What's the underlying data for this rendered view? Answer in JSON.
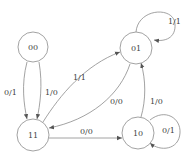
{
  "diagram": {
    "type": "state-machine",
    "states": [
      {
        "id": "s00",
        "label": "00"
      },
      {
        "id": "s01",
        "label": "01"
      },
      {
        "id": "s11",
        "label": "11"
      },
      {
        "id": "s10",
        "label": "10"
      }
    ],
    "transitions": [
      {
        "from": "00",
        "to": "11",
        "label": "0/1"
      },
      {
        "from": "00",
        "to": "11",
        "label": "1/0"
      },
      {
        "from": "11",
        "to": "01",
        "label": "1/1"
      },
      {
        "from": "01",
        "to": "11",
        "label": "0/0"
      },
      {
        "from": "11",
        "to": "10",
        "label": "0/0"
      },
      {
        "from": "10",
        "to": "01",
        "label": "1/0"
      },
      {
        "from": "01",
        "to": "01",
        "label": "1/1"
      },
      {
        "from": "10",
        "to": "10",
        "label": "0/1"
      }
    ]
  },
  "colors": {
    "stroke": "#8a8a8a",
    "text": "#444444",
    "background": "#ffffff"
  }
}
